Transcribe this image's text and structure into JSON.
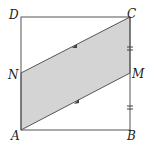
{
  "figure": {
    "type": "geometry-diagram",
    "points": {
      "A": {
        "label": "A",
        "x": 21,
        "y": 130
      },
      "B": {
        "label": "B",
        "x": 130,
        "y": 130
      },
      "C": {
        "label": "C",
        "x": 130,
        "y": 17
      },
      "D": {
        "label": "D",
        "x": 21,
        "y": 17
      },
      "N": {
        "label": "N",
        "x": 21,
        "y": 73
      },
      "M": {
        "label": "M",
        "x": 130,
        "y": 73
      }
    },
    "shaded_region": [
      "A",
      "N",
      "C",
      "M"
    ],
    "markings": {
      "parallel_arrows": [
        "NC",
        "AM"
      ],
      "equal_ticks": [
        "CM",
        "MB"
      ]
    },
    "colors": {
      "stroke": "#555555",
      "fill": "#d4d4d4"
    }
  }
}
